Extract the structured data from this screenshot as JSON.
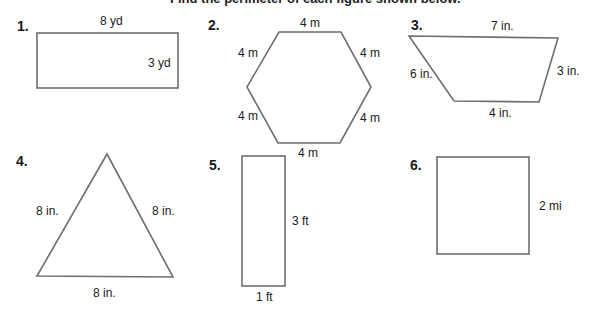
{
  "header": {
    "text": "Find the perimeter of each figure shown below."
  },
  "figures": [
    {
      "number": "1.",
      "shape": "rectangle",
      "labels": {
        "top": "8 yd",
        "right": "3 yd"
      }
    },
    {
      "number": "2.",
      "shape": "hexagon",
      "labels": {
        "top": "4 m",
        "upper_left": "4 m",
        "upper_right": "4 m",
        "lower_left": "4 m",
        "lower_right": "4 m",
        "bottom": "4 m"
      }
    },
    {
      "number": "3.",
      "shape": "trapezoid",
      "labels": {
        "top": "7 in.",
        "left": "6 in.",
        "right": "3 in.",
        "bottom": "4 in."
      }
    },
    {
      "number": "4.",
      "shape": "triangle",
      "labels": {
        "left": "8 in.",
        "right": "8 in.",
        "bottom": "8 in."
      }
    },
    {
      "number": "5.",
      "shape": "rectangle",
      "labels": {
        "right": "3 ft",
        "bottom": "1 ft"
      }
    },
    {
      "number": "6.",
      "shape": "square",
      "labels": {
        "right": "2 mi"
      }
    }
  ],
  "colors": {
    "stroke": "#6e6e6e",
    "text": "#1a1a1a"
  }
}
